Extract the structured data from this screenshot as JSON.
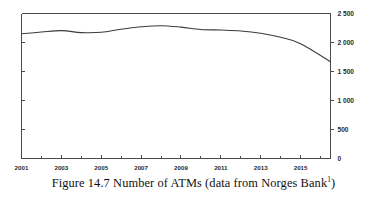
{
  "caption": {
    "text": "Figure 14.7 Number of ATMs (data from Norges Bank",
    "footnote_marker": "1",
    "closing": ")"
  },
  "chart_data": {
    "type": "line",
    "title": "",
    "subtitle": "",
    "xlabel": "",
    "ylabel": "",
    "xlim": [
      2001,
      2016.5
    ],
    "ylim": [
      0,
      2500
    ],
    "grid": false,
    "legend": null,
    "line_color": "#3a3a3a",
    "axis_color": "#4a4a4a",
    "background": "#ffffff",
    "x_tick_labels": [
      "2001",
      "2003",
      "2005",
      "2007",
      "2009",
      "2011",
      "2013",
      "2015"
    ],
    "x_tick_values": [
      2001,
      2003,
      2005,
      2007,
      2009,
      2011,
      2013,
      2015
    ],
    "x_minor_tick_values": [
      2002,
      2004,
      2006,
      2008,
      2010,
      2012,
      2014,
      2016
    ],
    "y_tick_labels": [
      "0",
      "500",
      "1 000",
      "1 500",
      "2 000",
      "2 500"
    ],
    "y_tick_values": [
      0,
      500,
      1000,
      1500,
      2000,
      2500
    ],
    "series": [
      {
        "name": "Number of ATMs",
        "x": [
          2001,
          2002,
          2003,
          2004,
          2005,
          2006,
          2007,
          2008,
          2009,
          2010,
          2011,
          2012,
          2013,
          2014,
          2015,
          2016.5
        ],
        "values": [
          2150,
          2180,
          2205,
          2170,
          2175,
          2230,
          2270,
          2290,
          2265,
          2225,
          2215,
          2200,
          2160,
          2090,
          1980,
          1670
        ]
      }
    ]
  }
}
